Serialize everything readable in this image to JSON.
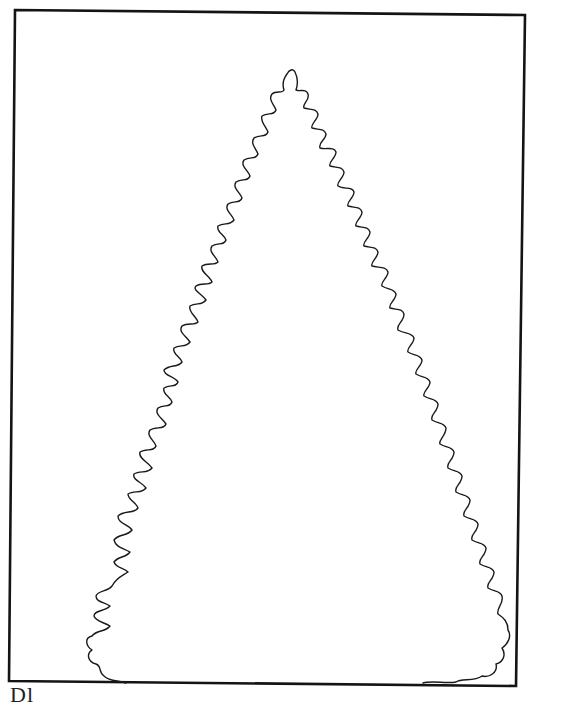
{
  "page": {
    "colors": {
      "background": "#ffffff",
      "ink": "#1a1a1a",
      "frame": "#141414"
    }
  },
  "frame": {
    "corners": {
      "top_left": [
        15,
        10
      ],
      "top_right": [
        525,
        15
      ],
      "bottom_right": [
        516,
        686
      ],
      "bottom_left": [
        9,
        681
      ]
    },
    "stroke_width": 2.6
  },
  "tree": {
    "shape": "fir-tree-outline",
    "tip": [
      291,
      70
    ],
    "base_left_x": 126,
    "base_right_x": 423,
    "base_y": 683
  },
  "caption": {
    "text": "Dl",
    "note": "partially cropped at bottom edge"
  }
}
